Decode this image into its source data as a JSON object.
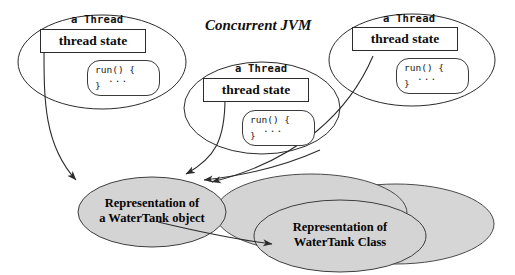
{
  "diagram": {
    "title": "Concurrent JVM",
    "background": "#ffffff",
    "stroke_color": "#2b2b2b",
    "gray_fill": "#d4d4d4",
    "threads": [
      {
        "id": "thread-left",
        "caption": "a Thread",
        "state_label": "thread state",
        "run_line1": "run() {",
        "run_dots": "...",
        "run_line3": "}"
      },
      {
        "id": "thread-middle",
        "caption": "a Thread",
        "state_label": "thread state",
        "run_line1": "run() {",
        "run_dots": "...",
        "run_line3": "}"
      },
      {
        "id": "thread-right",
        "caption": "a Thread",
        "state_label": "thread state",
        "run_line1": "run() {",
        "run_dots": "...",
        "run_line3": "}"
      }
    ],
    "object_node": {
      "line1": "Representation of",
      "line2": "a WaterTank object"
    },
    "class_node": {
      "line1": "Representation of",
      "line2": "WaterTank Class"
    }
  }
}
